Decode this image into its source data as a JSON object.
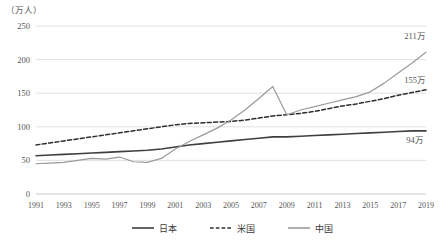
{
  "chart_data": {
    "type": "line",
    "title": "",
    "xlabel": "",
    "ylabel": "万人",
    "unit_label": "（万人）",
    "grid": true,
    "legend_position": "bottom",
    "xlim": [
      1991,
      2019
    ],
    "ylim": [
      0,
      250
    ],
    "yticks": [
      0,
      50,
      100,
      150,
      200,
      250
    ],
    "ytick_labels": [
      "0",
      "50",
      "100",
      "150",
      "200",
      "250"
    ],
    "x": [
      1991,
      1992,
      1993,
      1994,
      1995,
      1996,
      1997,
      1998,
      1999,
      2000,
      2001,
      2002,
      2003,
      2004,
      2005,
      2006,
      2007,
      2008,
      2009,
      2010,
      2011,
      2012,
      2013,
      2014,
      2015,
      2016,
      2017,
      2018,
      2019
    ],
    "xtick_labels": [
      "1991",
      "1993",
      "1995",
      "1997",
      "1999",
      "2001",
      "2003",
      "2005",
      "2007",
      "2009",
      "2011",
      "2013",
      "2015",
      "2017",
      "2019"
    ],
    "xticks": [
      1991,
      1993,
      1995,
      1997,
      1999,
      2001,
      2003,
      2005,
      2007,
      2009,
      2011,
      2013,
      2015,
      2017,
      2019
    ],
    "series": [
      {
        "name": "日本",
        "key": "japan",
        "style": "solid",
        "color": "#3f3f3f",
        "width": 1.6,
        "end_label": "94万",
        "values": [
          57,
          58,
          59,
          60,
          61,
          62,
          63,
          64,
          65,
          67,
          70,
          73,
          75,
          77,
          79,
          81,
          83,
          85,
          85,
          86,
          87,
          88,
          89,
          90,
          91,
          92,
          93,
          94,
          94
        ]
      },
      {
        "name": "米国",
        "key": "usa",
        "style": "dashed",
        "color": "#2e2e2e",
        "width": 1.5,
        "end_label": "155万",
        "values": [
          73,
          76,
          79,
          82,
          85,
          88,
          91,
          94,
          97,
          100,
          103,
          105,
          106,
          107,
          108,
          110,
          113,
          116,
          118,
          120,
          123,
          127,
          131,
          134,
          138,
          142,
          147,
          151,
          155
        ]
      },
      {
        "name": "中国",
        "key": "china",
        "style": "solid",
        "color": "#9a9a9a",
        "width": 1.2,
        "end_label": "211万",
        "values": [
          45,
          46,
          47,
          50,
          53,
          52,
          55,
          48,
          47,
          53,
          67,
          78,
          88,
          98,
          110,
          125,
          142,
          160,
          118,
          125,
          130,
          135,
          140,
          145,
          152,
          165,
          180,
          195,
          211
        ]
      }
    ]
  },
  "legend": {
    "items": [
      {
        "label": "日本",
        "style": "solid",
        "color": "#3f3f3f"
      },
      {
        "label": "米国",
        "style": "dashed",
        "color": "#2e2e2e"
      },
      {
        "label": "中国",
        "style": "solid",
        "color": "#9a9a9a"
      }
    ]
  }
}
